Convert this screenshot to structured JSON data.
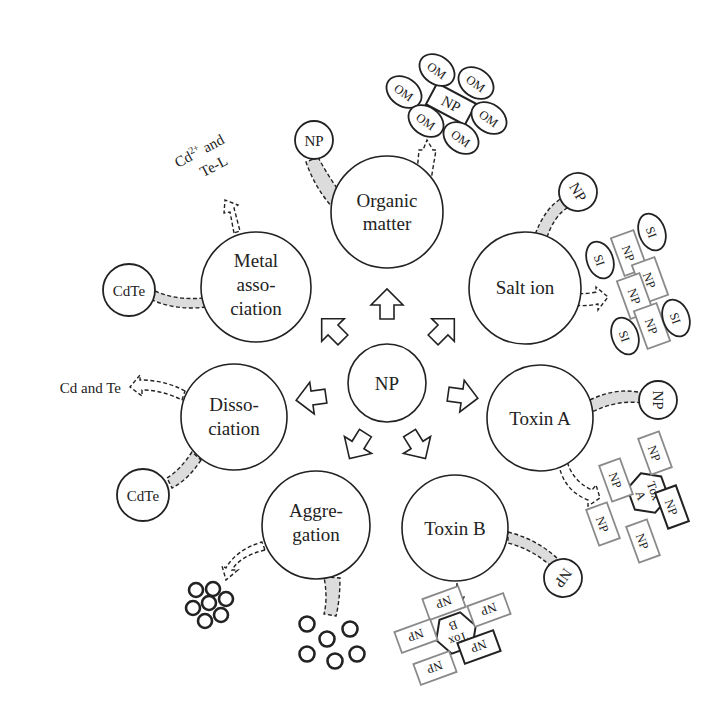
{
  "diagram": {
    "center": {
      "label": "NP"
    },
    "processes": [
      {
        "id": "organic-matter",
        "label_lines": [
          "Organic",
          "matter"
        ]
      },
      {
        "id": "salt-ion",
        "label_lines": [
          "Salt ion"
        ]
      },
      {
        "id": "toxin-a",
        "label_lines": [
          "Toxin A"
        ]
      },
      {
        "id": "toxin-b",
        "label_lines": [
          "Toxin B"
        ]
      },
      {
        "id": "aggregation",
        "label_lines": [
          "Aggre-",
          "gation"
        ]
      },
      {
        "id": "dissociation",
        "label_lines": [
          "Disso-",
          "ciation"
        ]
      },
      {
        "id": "metal-association",
        "label_lines": [
          "Metal",
          "asso-",
          "ciation"
        ]
      }
    ],
    "inputs": {
      "organic_matter": "NP",
      "salt_ion": "NP",
      "toxin_a": "NP",
      "toxin_b": "NP",
      "dissociation": "CdTe",
      "metal_association": "CdTe"
    },
    "products": {
      "organic_matter": {
        "core": "NP",
        "shell": "OM",
        "shell_count": 6
      },
      "salt_ion": {
        "core": "NP",
        "core_count": 4,
        "ion": "SI",
        "ion_count": 4
      },
      "toxin_a": {
        "core_line1": "Tox",
        "core_line2": "A",
        "np": "NP",
        "np_count": 5
      },
      "toxin_b": {
        "core_line1": "Tox",
        "core_line2": "B",
        "np": "NP",
        "np_count": 5
      },
      "aggregation": {
        "description": "clustered particles",
        "count": 7
      },
      "aggregation_input": {
        "description": "dispersed particles",
        "count": 6
      },
      "dissociation": "Cd and Te",
      "metal_association_line1": "Cd",
      "metal_association_sup": "2+",
      "metal_association_line1_end": " and",
      "metal_association_line2": "Te-L"
    }
  }
}
